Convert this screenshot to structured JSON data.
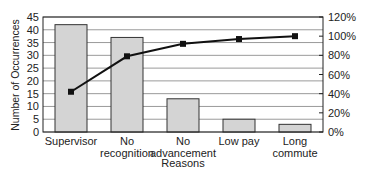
{
  "chart_data": {
    "type": "bar",
    "subtype": "pareto",
    "title": "",
    "xlabel": "Reasons",
    "ylabel": "Number of Occurrences",
    "y2label": "",
    "categories": [
      "Supervisor",
      "No recognition",
      "No advancement",
      "Low pay",
      "Long commute"
    ],
    "category_lines": [
      [
        "Supervisor"
      ],
      [
        "No",
        "recognition"
      ],
      [
        "No",
        "advancement"
      ],
      [
        "Low pay"
      ],
      [
        "Long",
        "commute"
      ]
    ],
    "series": [
      {
        "name": "Number of Occurrences",
        "type": "bar",
        "axis": "left",
        "values": [
          42,
          37,
          13,
          5,
          3
        ]
      },
      {
        "name": "Cumulative Percentage",
        "type": "line",
        "axis": "right",
        "values": [
          42,
          79,
          92,
          97,
          100
        ]
      }
    ],
    "ylim": [
      0,
      45
    ],
    "yticks": [
      0,
      5,
      10,
      15,
      20,
      25,
      30,
      35,
      40,
      45
    ],
    "y2lim": [
      0,
      120
    ],
    "y2ticks": [
      "0%",
      "20%",
      "40%",
      "60%",
      "80%",
      "100%",
      "120%"
    ],
    "y2tick_values": [
      0,
      20,
      40,
      60,
      80,
      100,
      120
    ],
    "grid": true,
    "legend": "none",
    "colors": {
      "bar_fill": "#d4d4d4",
      "bar_stroke": "#333333",
      "line": "#111111",
      "grid": "#9a9a9a"
    }
  }
}
